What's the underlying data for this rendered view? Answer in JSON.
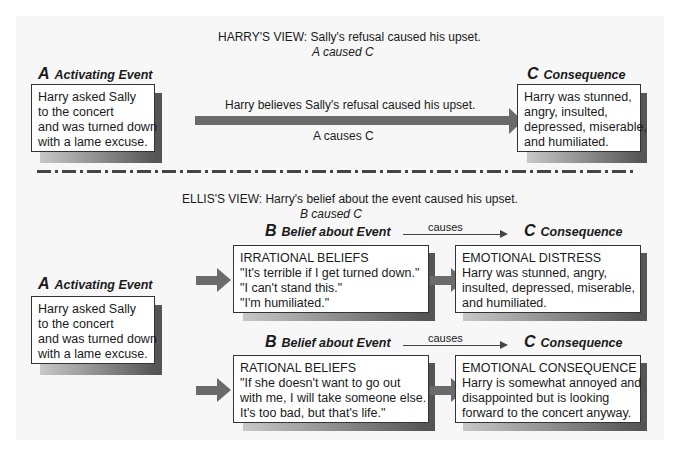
{
  "harry_view": {
    "title": "HARRY'S VIEW: Sally's refusal caused his upset.",
    "formula": "A caused C",
    "a_label": {
      "letter": "A",
      "text": "Activating Event"
    },
    "a_box": [
      "Harry asked Sally",
      "to the concert",
      "and was turned down",
      "with a lame excuse."
    ],
    "arrow_top": "Harry believes Sally's refusal caused his upset.",
    "arrow_bottom": "A causes C",
    "c_label": {
      "letter": "C",
      "text": "Consequence"
    },
    "c_box": [
      "Harry was stunned,",
      "angry, insulted,",
      "depressed, miserable,",
      "and humiliated."
    ]
  },
  "ellis_view": {
    "title": "ELLIS'S VIEW: Harry's belief about the event caused his upset.",
    "formula": "B caused C",
    "a_label": {
      "letter": "A",
      "text": "Activating Event"
    },
    "a_box": [
      "Harry asked Sally",
      "to the concert",
      "and was turned down",
      "with a lame excuse."
    ],
    "irrational": {
      "b_label": {
        "letter": "B",
        "text": "Belief about Event"
      },
      "causes": "causes",
      "c_label": {
        "letter": "C",
        "text": "Consequence"
      },
      "b_box": [
        "IRRATIONAL BELIEFS",
        "\"It's terrible if I get turned down.\"",
        "\"I can't stand this.\"",
        "\"I'm humiliated.\""
      ],
      "c_box": [
        "EMOTIONAL DISTRESS",
        "Harry was stunned, angry,",
        "insulted, depressed, miserable,",
        "and humiliated."
      ]
    },
    "rational": {
      "b_label": {
        "letter": "B",
        "text": "Belief about Event"
      },
      "causes": "causes",
      "c_label": {
        "letter": "C",
        "text": "Consequence"
      },
      "b_box": [
        "RATIONAL BELIEFS",
        "\"If she doesn't want to go out",
        "with me, I will take someone else.",
        "It's too bad, but that's life.\""
      ],
      "c_box": [
        "EMOTIONAL CONSEQUENCE",
        "Harry is somewhat annoyed and",
        "disappointed but is looking",
        "forward to the concert anyway."
      ]
    }
  },
  "colors": {
    "arrow": "#6b6b6b",
    "background": "#f7f7f7",
    "box_border": "#333333"
  }
}
